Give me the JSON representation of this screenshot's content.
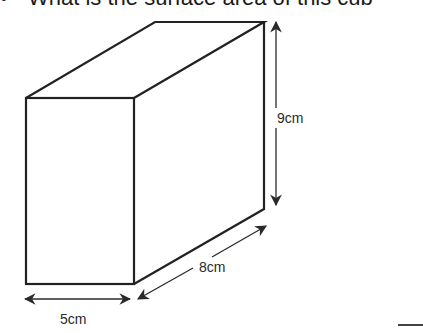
{
  "question": {
    "bullet": "•",
    "text": "What is the surface area of this cub"
  },
  "figure": {
    "shape": "cuboid",
    "colors": {
      "stroke": "#222222",
      "arrow": "#2a2a2a",
      "background": "#ffffff"
    },
    "dimensions": {
      "height": "9cm",
      "depth": "8cm",
      "width": "5cm"
    }
  }
}
